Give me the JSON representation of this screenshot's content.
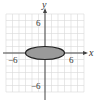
{
  "chart_data": {
    "type": "line",
    "title": "",
    "xlabel": "x",
    "ylabel": "y",
    "xlim": [
      -6,
      6
    ],
    "ylim": [
      -6,
      6
    ],
    "grid": true,
    "grid_step": 1,
    "tick_labels": {
      "x_neg": "−6",
      "x_pos": "6",
      "y_pos": "6",
      "y_neg": "−6"
    },
    "shapes": [
      {
        "kind": "ellipse",
        "center": [
          0,
          0
        ],
        "rx": 3,
        "ry": 1,
        "fill": "#9a9a9a",
        "stroke": "#222222"
      }
    ]
  },
  "colors": {
    "grid": "#d8d8d8",
    "axis": "#444444",
    "ellipse_fill": "#9a9a9a",
    "ellipse_stroke": "#222222"
  }
}
